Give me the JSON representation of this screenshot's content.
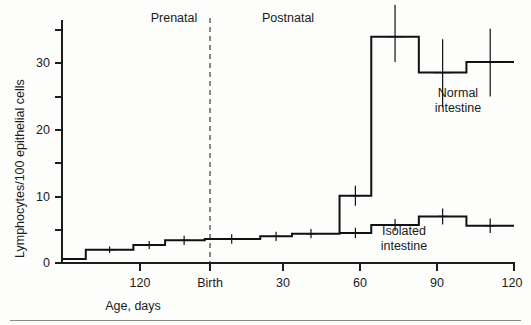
{
  "chart_data": {
    "type": "line",
    "subtype": "step-line-with-error-bars",
    "title": "",
    "xlabel": "Age, days",
    "ylabel": "Lymphocytes/100 epithelial cells",
    "xlim": [
      -165,
      120
    ],
    "ylim": [
      0,
      35
    ],
    "grid": false,
    "legend_position": "inline-annotation",
    "y_ticks": [
      0,
      5,
      10,
      15,
      20,
      25,
      30,
      35
    ],
    "y_tick_labels": [
      "0",
      "",
      "10",
      "",
      "20",
      "",
      "30",
      ""
    ],
    "x_ticks": [
      -120,
      0,
      30,
      60,
      90,
      120
    ],
    "x_tick_labels": [
      "120",
      "Birth",
      "30",
      "60",
      "90",
      "120"
    ],
    "annotations": [
      {
        "text": "Prenatal",
        "x": -95,
        "y": 35.5
      },
      {
        "text": "Postnatal",
        "x": 15,
        "y": 35.5
      }
    ],
    "divider": {
      "label": "Birth",
      "x": 0,
      "style": "dashed"
    },
    "series": [
      {
        "name": "Normal intestine",
        "label_x": 93,
        "label_y": 23,
        "steps": [
          {
            "x_start": -165,
            "x_end": -150,
            "value": 0.6
          },
          {
            "x_start": -150,
            "x_end": -120,
            "value": 2.0
          },
          {
            "x_start": -120,
            "x_end": -100,
            "value": 2.7
          },
          {
            "x_start": -100,
            "x_end": -75,
            "value": 3.4
          },
          {
            "x_start": -75,
            "x_end": -40,
            "value": 3.6
          },
          {
            "x_start": -40,
            "x_end": -20,
            "value": 4.0
          },
          {
            "x_start": -20,
            "x_end": 10,
            "value": 4.4
          },
          {
            "x_start": 10,
            "x_end": 30,
            "value": 10.1
          },
          {
            "x_start": 30,
            "x_end": 60,
            "value": 34.0
          },
          {
            "x_start": 60,
            "x_end": 90,
            "value": 28.6
          },
          {
            "x_start": 90,
            "x_end": 120,
            "value": 30.2
          }
        ],
        "error_bars": [
          {
            "x": -135,
            "value": 2.0,
            "lower": 1.5,
            "upper": 2.5
          },
          {
            "x": -110,
            "value": 2.7,
            "lower": 2.1,
            "upper": 3.3
          },
          {
            "x": -88,
            "value": 3.4,
            "lower": 2.7,
            "upper": 4.1
          },
          {
            "x": -58,
            "value": 3.6,
            "lower": 2.9,
            "upper": 4.3
          },
          {
            "x": -30,
            "value": 4.0,
            "lower": 3.3,
            "upper": 4.7
          },
          {
            "x": -8,
            "value": 4.4,
            "lower": 3.7,
            "upper": 5.1
          },
          {
            "x": 20,
            "value": 10.1,
            "lower": 8.6,
            "upper": 11.6
          },
          {
            "x": 45,
            "value": 34.0,
            "lower": 30.2,
            "upper": 38.8
          },
          {
            "x": 75,
            "value": 28.6,
            "lower": 23.4,
            "upper": 33.6
          },
          {
            "x": 105,
            "value": 30.2,
            "lower": 25.0,
            "upper": 35.2
          }
        ]
      },
      {
        "name": "Isolated intestine",
        "label_x": 64,
        "label_y": 5.0,
        "steps": [
          {
            "x_start": 10,
            "x_end": 30,
            "value": 4.5
          },
          {
            "x_start": 30,
            "x_end": 60,
            "value": 5.7
          },
          {
            "x_start": 60,
            "x_end": 90,
            "value": 7.0
          },
          {
            "x_start": 90,
            "x_end": 120,
            "value": 5.6
          }
        ],
        "error_bars": [
          {
            "x": 20,
            "value": 4.5,
            "lower": 3.7,
            "upper": 5.3
          },
          {
            "x": 45,
            "value": 5.7,
            "lower": 4.8,
            "upper": 6.6
          },
          {
            "x": 75,
            "value": 7.0,
            "lower": 5.8,
            "upper": 8.2
          },
          {
            "x": 105,
            "value": 5.6,
            "lower": 4.5,
            "upper": 6.7
          }
        ]
      }
    ],
    "colors": {
      "line": "#111111",
      "axis": "#1d1d1d",
      "text": "#1a1a1a",
      "background": "#fdfdfc"
    }
  },
  "labels": {
    "y_axis_title": "Lymphocytes/100 epithelial cells",
    "x_axis_title": "Age, days",
    "prenatal": "Prenatal",
    "postnatal": "Postnatal",
    "birth": "Birth",
    "normal_line1": "Normal",
    "normal_line2": "intestine",
    "isolated_line1": "Isolated",
    "isolated_line2": "intestine",
    "ytick_0": "0",
    "ytick_10": "10",
    "ytick_20": "20",
    "ytick_30": "30",
    "xtick_prenatal120": "120",
    "xtick_birth": "Birth",
    "xtick_30": "30",
    "xtick_60": "60",
    "xtick_90": "90",
    "xtick_120": "120"
  }
}
